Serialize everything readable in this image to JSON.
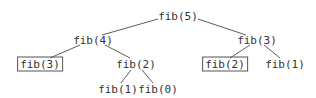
{
  "diagram": {
    "type": "recursion-tree",
    "line_color": "#333333",
    "nodes": [
      {
        "id": "n1",
        "label": "fib(5)",
        "x": 178,
        "y": 16,
        "boxed": false
      },
      {
        "id": "n2",
        "label": "fib(4)",
        "x": 93,
        "y": 40,
        "boxed": false
      },
      {
        "id": "n3",
        "label": "fib(3)",
        "x": 257,
        "y": 40,
        "boxed": false
      },
      {
        "id": "n4",
        "label": "fib(3)",
        "x": 40,
        "y": 64,
        "boxed": true
      },
      {
        "id": "n5",
        "label": "fib(2)",
        "x": 136,
        "y": 64,
        "boxed": false
      },
      {
        "id": "n6",
        "label": "fib(2)",
        "x": 225,
        "y": 64,
        "boxed": true
      },
      {
        "id": "n7",
        "label": "fib(1)",
        "x": 285,
        "y": 64,
        "boxed": false
      },
      {
        "id": "n8",
        "label": "fib(1)",
        "x": 118,
        "y": 89,
        "boxed": false
      },
      {
        "id": "n9",
        "label": "fib(0)",
        "x": 158,
        "y": 89,
        "boxed": false
      }
    ],
    "edges": [
      {
        "from": "n1",
        "to": "n2"
      },
      {
        "from": "n1",
        "to": "n3"
      },
      {
        "from": "n2",
        "to": "n4"
      },
      {
        "from": "n2",
        "to": "n5"
      },
      {
        "from": "n3",
        "to": "n6"
      },
      {
        "from": "n3",
        "to": "n7"
      },
      {
        "from": "n5",
        "to": "n8"
      },
      {
        "from": "n5",
        "to": "n9"
      }
    ]
  }
}
